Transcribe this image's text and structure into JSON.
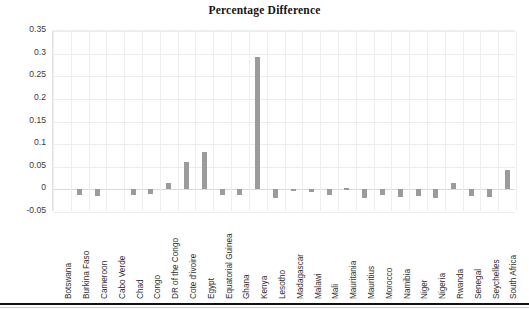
{
  "chart_data": {
    "type": "bar",
    "title": "Percentage Difference",
    "xlabel": "",
    "ylabel": "",
    "ylim": [
      -0.05,
      0.35
    ],
    "yticks": [
      0.35,
      0.3,
      0.25,
      0.2,
      0.15,
      0.1,
      0.05,
      0,
      -0.05
    ],
    "ytick_labels": [
      "0.35",
      "0.3",
      "0.25",
      "0.2",
      "0.15",
      "0.1",
      "0.05",
      "0",
      "-0.05"
    ],
    "grid": true,
    "legend": null,
    "bar_color": "#9b9b9b",
    "categories": [
      "Botswana",
      "Burkina Faso",
      "Cameroon",
      "Cabo Verde",
      "Chad",
      "Congo",
      "DR of the Congo",
      "Cote d'ivoire",
      "Egypt",
      "Equatorial Guinea",
      "Ghana",
      "Kenya",
      "Lesotho",
      "Madagascar",
      "Malawi",
      "Mali",
      "Mauritania",
      "Mauritius",
      "Morocco",
      "Namibia",
      "Niger",
      "Nigeria",
      "Rwanda",
      "Senegal",
      "Seychelles",
      "South Africa"
    ],
    "values": [
      0,
      -0.012,
      -0.015,
      0,
      -0.012,
      -0.011,
      0.013,
      0.06,
      0.083,
      -0.013,
      -0.013,
      0.293,
      -0.018,
      -0.004,
      -0.005,
      -0.013,
      0.003,
      -0.02,
      -0.013,
      -0.016,
      -0.014,
      -0.019,
      0.013,
      -0.014,
      -0.016,
      0.042
    ]
  },
  "axis": {
    "y_min_label": "-0.05",
    "y_max_label": "0.35"
  }
}
